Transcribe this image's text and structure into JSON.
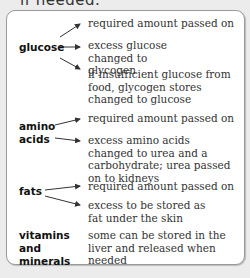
{
  "heading_cut": "if needed.",
  "rows": [
    {
      "source": "glucose",
      "targets": [
        "required amount passed on",
        "excess glucose changed to glycogen",
        "if insufficient glucose from food, glycogen stores changed to glucose"
      ]
    },
    {
      "source": "amino acids",
      "targets": [
        "required amount passed on",
        "excess amino acids changed to urea and a carbohydrate; urea passed on to kidneys"
      ]
    },
    {
      "source": "fats",
      "targets": [
        "required amount passed on",
        "excess to be stored as fat under the skin"
      ]
    },
    {
      "source": "vitamins and minerals",
      "targets": [
        "some can be stored in the liver and released when needed"
      ]
    }
  ]
}
